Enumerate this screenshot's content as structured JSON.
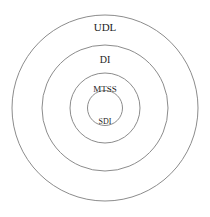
{
  "diagram": {
    "type": "concentric-circles",
    "background_color": "#ffffff",
    "stroke_color": "#8c8c8c",
    "text_color": "#1d1d1d",
    "center": {
      "x": 105,
      "y": 108
    },
    "rings": [
      {
        "id": "udl",
        "label": "UDL",
        "level": 1,
        "radius": 93,
        "label_x": 105,
        "label_y": 28,
        "font_size": 11
      },
      {
        "id": "di",
        "label": "DI",
        "level": 2,
        "radius": 63,
        "label_x": 105,
        "label_y": 61,
        "font_size": 10
      },
      {
        "id": "mtss",
        "label": "MTSS",
        "level": 3,
        "radius": 35,
        "label_x": 105,
        "label_y": 90,
        "font_size": 9
      },
      {
        "id": "sdi",
        "label": "SDI",
        "level": 4,
        "radius": 17.5,
        "label_x": 105,
        "label_y": 122,
        "font_size": 8
      }
    ]
  }
}
